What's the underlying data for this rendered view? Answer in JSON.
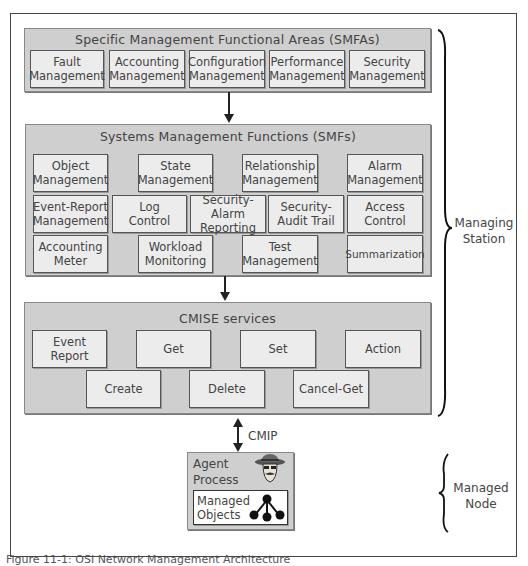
{
  "smfa": {
    "title": "Specific Management Functional Areas (SMFAs)",
    "items": [
      {
        "line1": "Fault",
        "line2": "Management"
      },
      {
        "line1": "Accounting",
        "line2": "Management"
      },
      {
        "line1": "Configuration",
        "line2": "Management"
      },
      {
        "line1": "Performance",
        "line2": "Management"
      },
      {
        "line1": "Security",
        "line2": "Management"
      }
    ]
  },
  "smf": {
    "title": "Systems Management Functions (SMFs)",
    "row1": [
      {
        "line1": "Object",
        "line2": "Management"
      },
      {
        "line1": "State",
        "line2": "Management"
      },
      {
        "line1": "Relationship",
        "line2": "Management"
      },
      {
        "line1": "Alarm",
        "line2": "Management"
      }
    ],
    "row2": [
      {
        "line1": "Event-Report",
        "line2": "Management"
      },
      {
        "line1": "Log",
        "line2": "Control"
      },
      {
        "line1": "Security-Alarm",
        "line2": "Reporting"
      },
      {
        "line1": "Security-",
        "line2": "Audit Trail"
      },
      {
        "line1": "Access",
        "line2": "Control"
      }
    ],
    "row3": [
      {
        "line1": "Accounting",
        "line2": "Meter"
      },
      {
        "line1": "Workload",
        "line2": "Monitoring"
      },
      {
        "line1": "Test",
        "line2": "Management"
      },
      {
        "line1": "Summarization",
        "line2": ""
      }
    ]
  },
  "cmise": {
    "title": "CMISE services",
    "row1": [
      {
        "line1": "Event",
        "line2": "Report"
      },
      {
        "line1": "Get",
        "line2": ""
      },
      {
        "line1": "Set",
        "line2": ""
      },
      {
        "line1": "Action",
        "line2": ""
      }
    ],
    "row2": [
      {
        "line1": "Create",
        "line2": ""
      },
      {
        "line1": "Delete",
        "line2": ""
      },
      {
        "line1": "Cancel-Get",
        "line2": ""
      }
    ]
  },
  "protocol_label": "CMIP",
  "agent": {
    "line1": "Agent",
    "line2": "Process",
    "objects_line1": "Managed",
    "objects_line2": "Objects"
  },
  "braces": {
    "managing_line1": "Managing",
    "managing_line2": "Station",
    "managed_line1": "Managed",
    "managed_line2": "Node"
  },
  "caption": "Figure 11-1: OSI Network Management Architecture"
}
